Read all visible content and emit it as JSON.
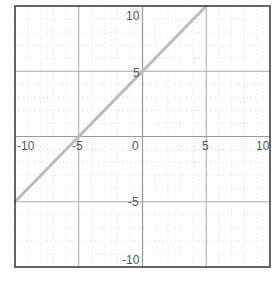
{
  "chart_data": {
    "type": "line",
    "title": "",
    "xlabel": "",
    "ylabel": "",
    "xlim": [
      -10,
      10
    ],
    "ylim": [
      -10,
      10
    ],
    "grid": {
      "major_step": 5,
      "minor_step": 1,
      "on": true
    },
    "x_ticks": [
      -10,
      -5,
      0,
      5,
      10
    ],
    "y_ticks": [
      10,
      5,
      -5,
      -10
    ],
    "x_tick_labels": [
      "-10",
      "-5",
      "0",
      "5",
      "10"
    ],
    "y_tick_labels": [
      "10",
      "5",
      "-5",
      "-10"
    ],
    "series": [
      {
        "name": "y = x + 5",
        "x": [
          -10,
          5
        ],
        "y": [
          -5,
          10
        ]
      }
    ]
  },
  "colors": {
    "background": "#ffffff",
    "border": "#333333",
    "axis": "#999999",
    "major_grid": "#aaaaaa",
    "minor_grid": "#dddddd",
    "line": "#bbbbbb",
    "label": "#555555"
  },
  "labels": {
    "x": {
      "n10": "-10",
      "n5": "-5",
      "zero": "0",
      "p5": "5",
      "p10": "10"
    },
    "y": {
      "p10": "10",
      "p5": "5",
      "n5": "-5",
      "n10": "-10"
    }
  }
}
